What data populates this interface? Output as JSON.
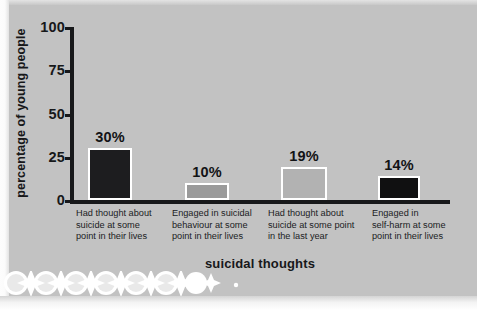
{
  "figure": {
    "background_color": "#c2c2c2",
    "axis_color": "#17181a",
    "bar_outline_color": "#ffffff"
  },
  "chart_data": {
    "type": "bar",
    "title": "",
    "xlabel": "suicidal thoughts",
    "ylabel": "percentage of young people",
    "ylim": [
      0,
      100
    ],
    "yticks": [
      0,
      25,
      50,
      75,
      100
    ],
    "ytick_labels": [
      "0",
      "25",
      "50",
      "75",
      "100"
    ],
    "grid": false,
    "legend": "none",
    "categories": [
      "Had thought about suicide at some point in their lives",
      "Engaged in suicidal behaviour at some point in their lives",
      "Had thought about suicide at some point in the last year",
      "Engaged in self-harm at some point in their lives"
    ],
    "category_lines": [
      [
        "Had thought about",
        "suicide at some",
        "point in their lives"
      ],
      [
        "Engaged in suicidal",
        "behaviour at some",
        "point in their lives"
      ],
      [
        "Had thought about",
        "suicide at some point",
        "in the last year"
      ],
      [
        "Engaged in",
        "self-harm at some",
        "point in their lives"
      ]
    ],
    "values": [
      30,
      10,
      19,
      14
    ],
    "value_labels": [
      "30%",
      "10%",
      "19%",
      "14%"
    ],
    "bar_colors": [
      "#1d1d1f",
      "#9a9a9a",
      "#b2b2b2",
      "#101011"
    ]
  }
}
